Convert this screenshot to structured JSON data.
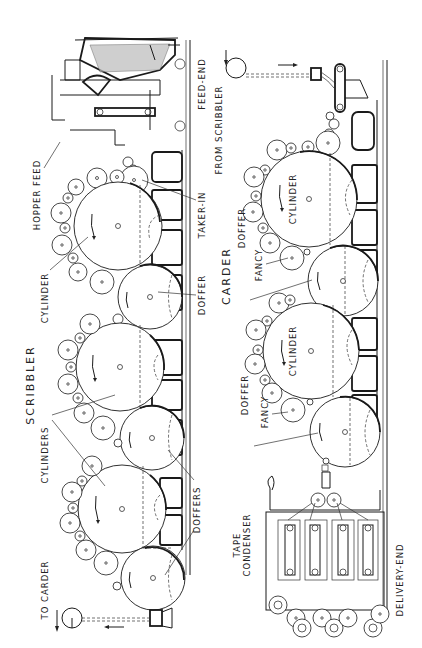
{
  "figure": {
    "orientation": "rotated 90 degrees counter-clockwise",
    "sections": [
      {
        "name": "scribbler",
        "title": "SCRIBBLER",
        "labels": {
          "feed_end": "FEED-END",
          "hopper_feed": "HOPPER FEED",
          "taker_in": "TAKER-IN",
          "cylinder": "CYLINDER",
          "doffer": "DOFFER",
          "cylinders": "CYLINDERS",
          "doffers": "DOFFERS",
          "to_carder": "TO CARDER"
        }
      },
      {
        "name": "carder",
        "title": "CARDER",
        "labels": {
          "from_scribbler": "FROM SCRIBBLER",
          "cylinder_1": "CYLINDER",
          "cylinder_2": "CYLINDER",
          "fancy_1": "FANCY",
          "fancy_2": "FANCY",
          "doffer_1": "DOFFER",
          "doffer_2": "DOFFER",
          "tape_condenser": "TAPE\nCONDENSER",
          "tape": "TAPE",
          "condenser": "CONDENSER",
          "delivery_end": "DELIVERY-END"
        }
      }
    ],
    "colors": {
      "ink": "#1a1a1a",
      "paper": "#ffffff"
    }
  }
}
